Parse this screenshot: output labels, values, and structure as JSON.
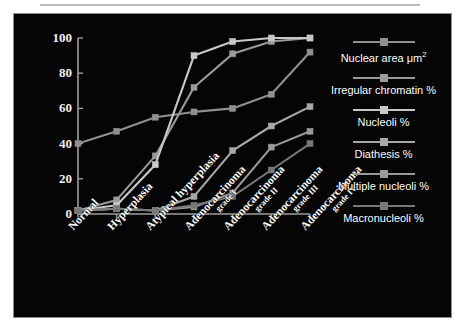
{
  "chart_data": {
    "type": "line",
    "title": "",
    "xlabel": "",
    "ylabel": "",
    "ylim": [
      0,
      100
    ],
    "yticks": [
      0,
      20,
      40,
      60,
      80,
      100
    ],
    "grid": false,
    "legend_position": "right",
    "categories": [
      "Normal",
      "Hyperplasia",
      "Atypical hyperplasia",
      "Adenocarcinoma grade I",
      "Adenocarcinoma grade II",
      "Adenocarcinoma grade III",
      "Adenocarcinoma grade IV"
    ],
    "category_lines": [
      {
        "main": "Normal",
        "sub": ""
      },
      {
        "main": "Hyperplasia",
        "sub": ""
      },
      {
        "main": "Atypical hyperplasia",
        "sub": ""
      },
      {
        "main": "Adenocarcinoma",
        "sub": "grade I"
      },
      {
        "main": "Adenocarcinoma",
        "sub": "grade II"
      },
      {
        "main": "Adenocarcinoma",
        "sub": "grade III"
      },
      {
        "main": "Adenocarcinoma",
        "sub": "grade IV"
      }
    ],
    "series": [
      {
        "name": "Nuclear area μm²",
        "label_main": "Nuclear area μm",
        "label_sup": "2",
        "color": "#8f8f8f",
        "values": [
          40,
          47,
          55,
          58,
          60,
          68,
          92
        ]
      },
      {
        "name": "Irregular chromatin %",
        "label_main": "Irregular chromatin %",
        "label_sup": "",
        "color": "#9a9a9a",
        "values": [
          2,
          8,
          33,
          72,
          91,
          98,
          100
        ]
      },
      {
        "name": "Nucleoli %",
        "label_main": "Nucleoli %",
        "label_sup": "",
        "color": "#c8c8c8",
        "values": [
          2,
          5,
          28,
          90,
          98,
          100,
          100
        ]
      },
      {
        "name": "Diathesis %",
        "label_main": "Diathesis %",
        "label_sup": "",
        "color": "#a8a8a8",
        "values": [
          2,
          3,
          2,
          10,
          36,
          50,
          61
        ]
      },
      {
        "name": "Multiple nucleoli %",
        "label_main": "Multiple nucleoli %",
        "label_sup": "",
        "color": "#999999",
        "values": [
          2,
          3,
          2,
          4,
          12,
          38,
          47
        ]
      },
      {
        "name": "Macronucleoli %",
        "label_main": "Macronucleoli %",
        "label_sup": "",
        "color": "#777777",
        "values": [
          2,
          3,
          2,
          5,
          10,
          25,
          40
        ]
      }
    ]
  },
  "figure": {
    "background": "#050505",
    "axis_color": "#9d9d9d",
    "text_color": "#ffffff"
  }
}
